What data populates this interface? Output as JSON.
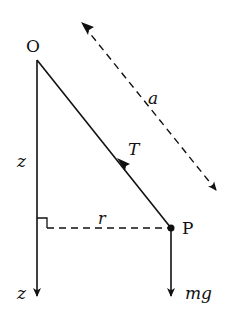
{
  "diagram": {
    "labels": {
      "pivot": "O",
      "bob": "P",
      "string_length": "a",
      "tension": "T",
      "radius": "r",
      "height": "z",
      "z_axis": "z",
      "weight": "mg"
    },
    "colors": {
      "stroke": "#111111",
      "background": "#ffffff"
    }
  }
}
